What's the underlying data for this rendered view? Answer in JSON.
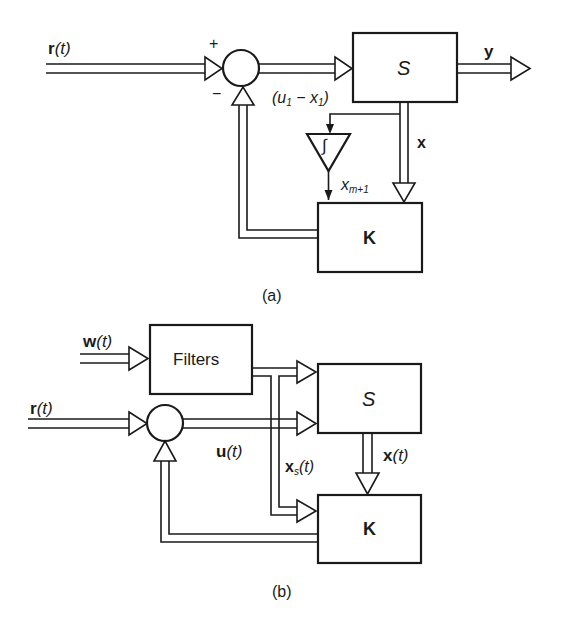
{
  "diagram_a": {
    "caption": "(a)",
    "input_label_bold": "r",
    "input_label_arg": "(t)",
    "plus_sign": "+",
    "minus_sign": "−",
    "plant_label": "S",
    "output_label": "y",
    "error_label_open": "(u",
    "error_sub1": "1",
    "error_label_mid": " − x",
    "error_sub2": "1",
    "error_label_close": ")",
    "integrator_symbol": "∫",
    "integrator_out_label": "x",
    "integrator_out_sub": "m+1",
    "state_label": "x",
    "gain_label": "K"
  },
  "diagram_b": {
    "caption": "(b)",
    "disturbance_label_bold": "w",
    "disturbance_label_arg": "(t)",
    "filter_label": "Filters",
    "input_label_bold": "r",
    "input_label_arg": "(t)",
    "control_label_bold": "u",
    "control_label_arg": "(t)",
    "filter_state_label_bold": "x",
    "filter_state_sub": "s",
    "filter_state_arg": "(t)",
    "plant_label": "S",
    "state_label_bold": "x",
    "state_label_arg": "(t)",
    "gain_label": "K"
  }
}
